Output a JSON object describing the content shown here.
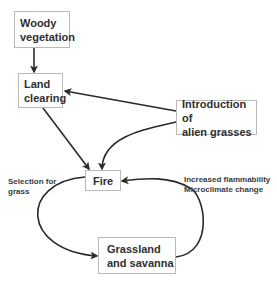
{
  "nodes": {
    "woody": {
      "line1": "Woody",
      "line2": "vegetation"
    },
    "land_clearing": {
      "line1": "Land",
      "line2": "clearing"
    },
    "alien_grasses": {
      "line1": "Introduction of",
      "line2": "alien grasses"
    },
    "fire": {
      "line1": "Fire"
    },
    "grassland": {
      "line1": "Grassland",
      "line2": "and savanna"
    }
  },
  "edge_labels": {
    "selection": {
      "line1": "Selection for",
      "line2": "grass"
    },
    "feedback": {
      "line1": "Increased flammability",
      "line2": "Microclimate change"
    }
  },
  "edges": [
    {
      "from": "Woody vegetation",
      "to": "Land clearing"
    },
    {
      "from": "Introduction of alien grasses",
      "to": "Land clearing"
    },
    {
      "from": "Land clearing",
      "to": "Fire"
    },
    {
      "from": "Introduction of alien grasses",
      "to": "Fire"
    },
    {
      "from": "Fire",
      "to": "Grassland and savanna",
      "label": "Selection for grass"
    },
    {
      "from": "Grassland and savanna",
      "to": "Fire",
      "label": "Increased flammability / Microclimate change"
    }
  ],
  "colors": {
    "line": "#2a2a2a",
    "box_border": "#b9b9b9",
    "text": "#2f2f2f"
  }
}
